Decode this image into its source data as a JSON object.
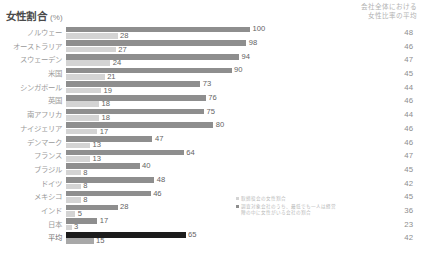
{
  "header": {
    "title": "女性割合",
    "title_unit": "(%)",
    "right_title_line1": "会社全体における",
    "right_title_line2": "女性比率の平均"
  },
  "legend": {
    "items": [
      {
        "swatch": "light",
        "label": "取締役会の女性割合"
      },
      {
        "swatch": "dark",
        "label": "調査対象会社のうち、最低でも一人は経営陣の中に女性がいる会社の割合"
      }
    ]
  },
  "chart_data": {
    "type": "bar",
    "title": "女性割合 (%)",
    "xlabel": "",
    "ylabel": "",
    "orientation": "horizontal",
    "grid": false,
    "legend_position": "inside-bottom-right",
    "xlim": [
      0,
      100
    ],
    "categories": [
      "ノルウェー",
      "オーストラリア",
      "スウェーデン",
      "米国",
      "シンガポール",
      "英国",
      "南アフリカ",
      "ナイジェリア",
      "デンマーク",
      "フランス",
      "ブラジル",
      "ドイツ",
      "メキシコ",
      "インド",
      "日本",
      "平均"
    ],
    "series": [
      {
        "name": "調査対象会社のうち、最低でも一人は経営陣の中に女性がいる会社の割合",
        "color": "#8e8e8e",
        "values": [
          100,
          98,
          94,
          90,
          73,
          76,
          75,
          80,
          47,
          64,
          40,
          48,
          46,
          28,
          17,
          65
        ]
      },
      {
        "name": "取締役会の女性割合",
        "color": "#d4d4d4",
        "values": [
          28,
          27,
          24,
          21,
          19,
          18,
          18,
          17,
          13,
          13,
          8,
          8,
          8,
          5,
          3,
          15
        ]
      }
    ],
    "right_column": {
      "header": "会社全体における女性比率の平均",
      "values": [
        48,
        46,
        47,
        45,
        44,
        46,
        44,
        46,
        46,
        47,
        45,
        42,
        45,
        36,
        23,
        42
      ]
    }
  },
  "rows": [
    {
      "label": "ノルウェー",
      "dark": 100,
      "light": 28,
      "right": 48
    },
    {
      "label": "オーストラリア",
      "dark": 98,
      "light": 27,
      "right": 46
    },
    {
      "label": "スウェーデン",
      "dark": 94,
      "light": 24,
      "right": 47
    },
    {
      "label": "米国",
      "dark": 90,
      "light": 21,
      "right": 45
    },
    {
      "label": "シンガポール",
      "dark": 73,
      "light": 19,
      "right": 44
    },
    {
      "label": "英国",
      "dark": 76,
      "light": 18,
      "right": 46
    },
    {
      "label": "南アフリカ",
      "dark": 75,
      "light": 18,
      "right": 44
    },
    {
      "label": "ナイジェリア",
      "dark": 80,
      "light": 17,
      "right": 46
    },
    {
      "label": "デンマーク",
      "dark": 47,
      "light": 13,
      "right": 46
    },
    {
      "label": "フランス",
      "dark": 64,
      "light": 13,
      "right": 47
    },
    {
      "label": "ブラジル",
      "dark": 40,
      "light": 8,
      "right": 45
    },
    {
      "label": "ドイツ",
      "dark": 48,
      "light": 8,
      "right": 42
    },
    {
      "label": "メキシコ",
      "dark": 46,
      "light": 8,
      "right": 45
    },
    {
      "label": "インド",
      "dark": 28,
      "light": 5,
      "right": 36
    },
    {
      "label": "日本",
      "dark": 17,
      "light": 3,
      "right": 23
    },
    {
      "label": "平均",
      "dark": 65,
      "light": 15,
      "right": 42
    }
  ]
}
